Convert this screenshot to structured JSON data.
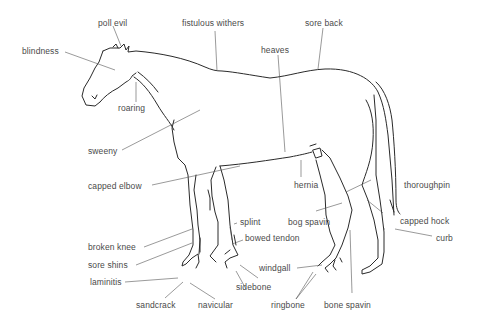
{
  "diagram": {
    "line_color": "#2a2a2a",
    "text_color": "#4a4a4a",
    "labels": [
      {
        "id": "poll-evil",
        "text": "poll evil"
      },
      {
        "id": "fistulous-withers",
        "text": "fistulous withers"
      },
      {
        "id": "sore-back",
        "text": "sore back"
      },
      {
        "id": "blindness",
        "text": "blindness"
      },
      {
        "id": "heaves",
        "text": "heaves"
      },
      {
        "id": "roaring",
        "text": "roaring"
      },
      {
        "id": "sweeny",
        "text": "sweeny"
      },
      {
        "id": "capped-elbow",
        "text": "capped elbow"
      },
      {
        "id": "hernia",
        "text": "hernia"
      },
      {
        "id": "thoroughpin",
        "text": "thoroughpin"
      },
      {
        "id": "splint",
        "text": "splint"
      },
      {
        "id": "bog-spavin",
        "text": "bog spavin"
      },
      {
        "id": "capped-hock",
        "text": "capped hock"
      },
      {
        "id": "bowed-tendon",
        "text": "bowed tendon"
      },
      {
        "id": "curb",
        "text": "curb"
      },
      {
        "id": "broken-knee",
        "text": "broken knee"
      },
      {
        "id": "windgall",
        "text": "windgall"
      },
      {
        "id": "sore-shins",
        "text": "sore shins"
      },
      {
        "id": "sidebone",
        "text": "sidebone"
      },
      {
        "id": "laminitis",
        "text": "laminitis"
      },
      {
        "id": "sandcrack",
        "text": "sandcrack"
      },
      {
        "id": "navicular",
        "text": "navicular"
      },
      {
        "id": "ringbone",
        "text": "ringbone"
      },
      {
        "id": "bone-spavin",
        "text": "bone spavin"
      }
    ]
  }
}
